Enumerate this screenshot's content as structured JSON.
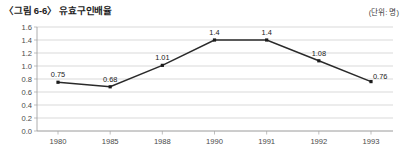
{
  "figure": {
    "title": "〈그림 6-6〉 유효구인배율",
    "unit_note": "(단위: 명)"
  },
  "chart_data": {
    "type": "line",
    "title": "〈그림 6-6〉 유효구인배율",
    "xlabel": "",
    "ylabel": "",
    "unit_note": "(단위: 명)",
    "categories": [
      "1980",
      "1985",
      "1988",
      "1990",
      "1991",
      "1992",
      "1993"
    ],
    "values": [
      0.75,
      0.68,
      1.01,
      1.4,
      1.4,
      1.08,
      0.76
    ],
    "point_labels": [
      "0.75",
      "0.68",
      "1.01",
      "1.4",
      "1.4",
      "1.08",
      "0.76"
    ],
    "ylim": [
      0.0,
      1.6
    ],
    "ytick_labels": [
      "0.0",
      "0.2",
      "0.4",
      "0.6",
      "0.8",
      "1.0",
      "1.2",
      "1.4",
      "1.6"
    ],
    "ytick_values": [
      0.0,
      0.2,
      0.4,
      0.6,
      0.8,
      1.0,
      1.2,
      1.4,
      1.6
    ],
    "grid": "horizontal",
    "legend": "none",
    "series_color": "#2a2a2a",
    "grid_color": "#c9c9c9",
    "axis_color": "#9a9a9a"
  }
}
